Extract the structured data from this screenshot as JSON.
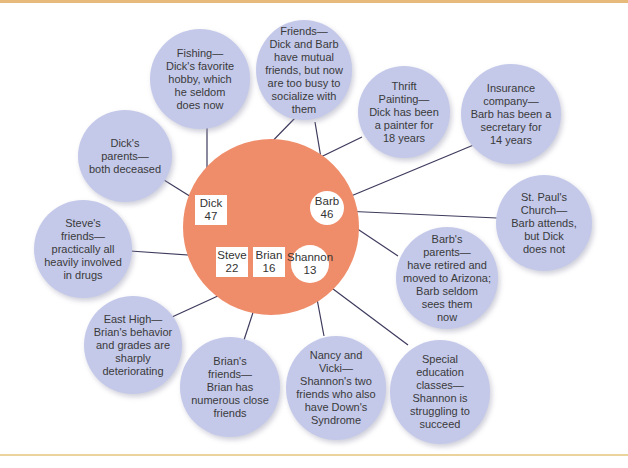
{
  "diagram": {
    "type": "ecomap",
    "colors": {
      "family_circle": "#ef8c69",
      "resource_bubble": "#c4c9ea",
      "connector": "#3d3a5c",
      "top_rule": "#e7b97a",
      "bottom_rule": "#ebd39e"
    },
    "family": {
      "members": [
        {
          "id": "dick",
          "name": "Dick",
          "age": "47",
          "shape": "square",
          "label": "Dick\n47"
        },
        {
          "id": "barb",
          "name": "Barb",
          "age": "46",
          "shape": "circle",
          "label": "Barb\n46"
        },
        {
          "id": "steve",
          "name": "Steve",
          "age": "22",
          "shape": "square",
          "label": "Steve\n22"
        },
        {
          "id": "brian",
          "name": "Brian",
          "age": "16",
          "shape": "square",
          "label": "Brian\n16"
        },
        {
          "id": "shannon",
          "name": "Shannon",
          "age": "13",
          "shape": "circle",
          "label": "Shannon\n13"
        }
      ]
    },
    "resources": [
      {
        "id": "fishing",
        "text": "Fishing—\nDick's favorite\nhobby, which\nhe seldom\ndoes now",
        "connects": "dick"
      },
      {
        "id": "friends",
        "text": "Friends—\nDick and Barb\nhave mutual\nfriends, but now\nare too busy to\nsocialize with\nthem",
        "connects": [
          "dick",
          "barb"
        ]
      },
      {
        "id": "thrift-painting",
        "text": "Thrift\nPainting—\nDick has been\na painter for\n18 years",
        "connects": "dick"
      },
      {
        "id": "insurance",
        "text": "Insurance\ncompany—\nBarb has been a\nsecretary for\n14 years",
        "connects": "barb"
      },
      {
        "id": "dicks-parents",
        "text": "Dick's\nparents—\nboth deceased",
        "connects": "dick"
      },
      {
        "id": "st-pauls",
        "text": "St. Paul's\nChurch—\nBarb attends,\nbut Dick\ndoes not",
        "connects": "barb"
      },
      {
        "id": "steves-friends",
        "text": "Steve's\nfriends—\npractically all\nheavily involved\nin drugs",
        "connects": "steve"
      },
      {
        "id": "barbs-parents",
        "text": "Barb's\nparents—\nhave retired and\nmoved to Arizona;\nBarb seldom\nsees them\nnow",
        "connects": "barb"
      },
      {
        "id": "east-high",
        "text": "East High—\nBrian's behavior\nand grades are\nsharply\ndeteriorating",
        "connects": "brian"
      },
      {
        "id": "brians-friends",
        "text": "Brian's\nfriends—\nBrian has\nnumerous close\nfriends",
        "connects": "brian"
      },
      {
        "id": "nancy-vicki",
        "text": "Nancy and\nVicki—\nShannon's two\nfriends who also\nhave Down's\nSyndrome",
        "connects": "shannon"
      },
      {
        "id": "special-ed",
        "text": "Special\neducation\nclasses—\nShannon is\nstruggling to\nsucceed",
        "connects": "shannon"
      }
    ]
  }
}
